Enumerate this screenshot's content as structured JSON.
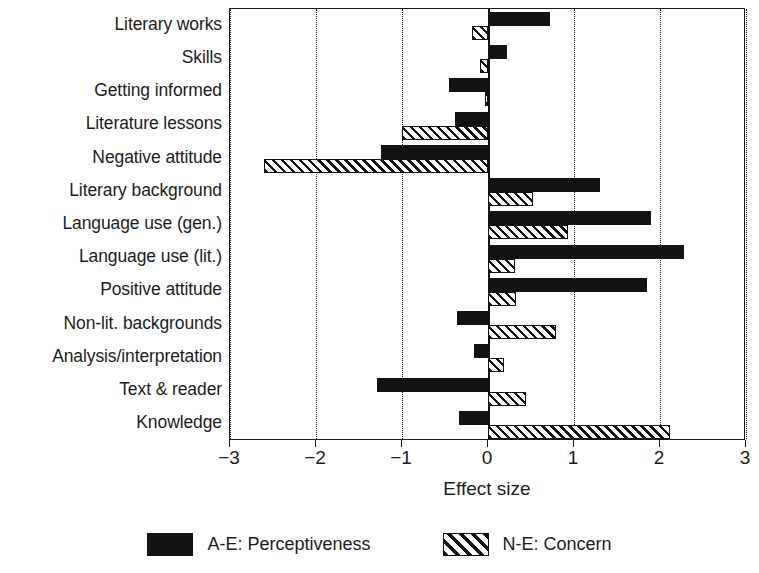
{
  "chart_data": {
    "type": "bar",
    "orientation": "horizontal",
    "title": "",
    "xlabel": "Effect size",
    "ylabel": "",
    "xlim": [
      -3,
      3
    ],
    "xticks": [
      -3,
      -2,
      -1,
      0,
      1,
      2,
      3
    ],
    "xtick_labels": [
      "−3",
      "−2",
      "−1",
      "0",
      "1",
      "2",
      "3"
    ],
    "grid": "vertical dotted gridlines at each tick; solid zero reference line",
    "legend_position": "bottom-center",
    "categories": [
      "Literary works",
      "Skills",
      "Getting informed",
      "Literature lessons",
      "Negative attitude",
      "Literary background",
      "Language use (gen.)",
      "Language use (lit.)",
      "Positive attitude",
      "Non-lit. backgrounds",
      "Analysis/interpretation",
      "Text & reader",
      "Knowledge"
    ],
    "series": [
      {
        "name": "A-E: Perceptiveness",
        "style": "solid-black",
        "color": "#121212",
        "values": [
          0.72,
          0.22,
          -0.45,
          -0.38,
          -1.24,
          1.3,
          1.9,
          2.28,
          1.85,
          -0.36,
          -0.16,
          -1.29,
          -0.34
        ]
      },
      {
        "name": "N-E: Concern",
        "style": "hatched",
        "color": "#ffffff",
        "values": [
          -0.19,
          -0.09,
          -0.04,
          -1.0,
          -2.6,
          0.52,
          0.93,
          0.31,
          0.33,
          0.79,
          0.19,
          0.44,
          2.12
        ]
      }
    ]
  },
  "legend": {
    "items": [
      {
        "label": "A-E: Perceptiveness",
        "style": "solid"
      },
      {
        "label": "N-E: Concern",
        "style": "hatch"
      }
    ]
  }
}
